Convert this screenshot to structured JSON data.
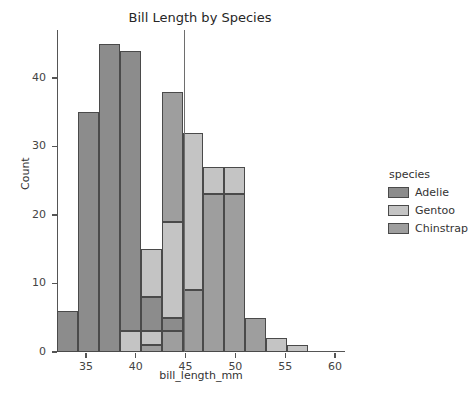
{
  "chart_data": {
    "type": "bar",
    "subtype": "stacked-histogram",
    "title": "Bill Length by Species",
    "xlabel": "bill_length_mm",
    "ylabel": "Count",
    "xlim": [
      32.1,
      61.0
    ],
    "ylim": [
      0,
      47
    ],
    "grid": false,
    "legend_position": "right",
    "legend_title": "species",
    "xticks": [
      35,
      40,
      45,
      50,
      55,
      60
    ],
    "yticks": [
      0,
      10,
      20,
      30,
      40
    ],
    "bin_width": 2.1,
    "bin_edges": [
      32.1,
      34.2,
      36.3,
      38.4,
      40.5,
      42.6,
      44.7,
      46.8,
      48.9,
      51.0,
      53.1,
      55.2,
      57.3,
      59.4
    ],
    "series": [
      {
        "name": "Adelie",
        "color": "#8c8c8c",
        "values": [
          6,
          35,
          45,
          41,
          5,
          3,
          0,
          0,
          0,
          0,
          0,
          0,
          0
        ]
      },
      {
        "name": "Gentoo",
        "color": "#c4c4c4",
        "values": [
          0,
          0,
          0,
          3,
          2,
          16,
          23,
          18,
          0,
          0,
          2,
          1,
          0
        ]
      },
      {
        "name": "Chinstrap",
        "color": "#9e9e9e",
        "values": [
          0,
          0,
          0,
          0,
          8,
          19,
          9,
          23,
          27,
          5,
          0,
          0,
          1
        ]
      }
    ],
    "bins": [
      {
        "x0": 32.1,
        "x1": 34.2,
        "total": 6,
        "segments": [
          {
            "species": "Adelie",
            "value": 6
          }
        ]
      },
      {
        "x0": 34.2,
        "x1": 36.3,
        "total": 35,
        "segments": [
          {
            "species": "Adelie",
            "value": 35
          }
        ]
      },
      {
        "x0": 36.3,
        "x1": 38.4,
        "total": 45,
        "segments": [
          {
            "species": "Adelie",
            "value": 45
          }
        ]
      },
      {
        "x0": 38.4,
        "x1": 40.5,
        "total": 44,
        "segments": [
          {
            "species": "Gentoo",
            "value": 3
          },
          {
            "species": "Adelie",
            "value": 41
          }
        ]
      },
      {
        "x0": 40.5,
        "x1": 42.6,
        "total": 15,
        "segments": [
          {
            "species": "Chinstrap",
            "value": 1
          },
          {
            "species": "Gentoo",
            "value": 2
          },
          {
            "species": "Adelie",
            "value": 5
          },
          {
            "species": "Gentoo",
            "value": 7
          }
        ]
      },
      {
        "x0": 42.6,
        "x1": 44.7,
        "total": 38,
        "segments": [
          {
            "species": "Chinstrap",
            "value": 3
          },
          {
            "species": "Adelie",
            "value": 2
          },
          {
            "species": "Gentoo",
            "value": 14
          },
          {
            "species": "Chinstrap",
            "value": 19
          }
        ]
      },
      {
        "x0": 44.7,
        "x1": 46.8,
        "total": 32,
        "segments": [
          {
            "species": "Chinstrap",
            "value": 9
          },
          {
            "species": "Gentoo",
            "value": 23
          }
        ]
      },
      {
        "x0": 46.8,
        "x1": 48.9,
        "total": 27,
        "segments": [
          {
            "species": "Chinstrap",
            "value": 23
          },
          {
            "species": "Gentoo",
            "value": 4
          }
        ]
      },
      {
        "x0": 48.9,
        "x1": 51.0,
        "total": 27,
        "segments": [
          {
            "species": "Chinstrap",
            "value": 23
          },
          {
            "species": "Gentoo",
            "value": 4
          }
        ]
      },
      {
        "x0": 51.0,
        "x1": 53.1,
        "total": 5,
        "segments": [
          {
            "species": "Chinstrap",
            "value": 5
          }
        ]
      },
      {
        "x0": 53.1,
        "x1": 55.2,
        "total": 2,
        "segments": [
          {
            "species": "Gentoo",
            "value": 2
          }
        ]
      },
      {
        "x0": 55.2,
        "x1": 57.3,
        "total": 1,
        "segments": [
          {
            "species": "Gentoo",
            "value": 1
          }
        ]
      }
    ],
    "annotations": [
      {
        "type": "vertical-line",
        "x": 44.8,
        "y0": 0,
        "y1": 47,
        "color": "#6e6e6e"
      }
    ]
  },
  "legend": {
    "title": "species",
    "entries": [
      {
        "label": "Adelie",
        "color": "#8c8c8c"
      },
      {
        "label": "Gentoo",
        "color": "#c4c4c4"
      },
      {
        "label": "Chinstrap",
        "color": "#9e9e9e"
      }
    ]
  }
}
